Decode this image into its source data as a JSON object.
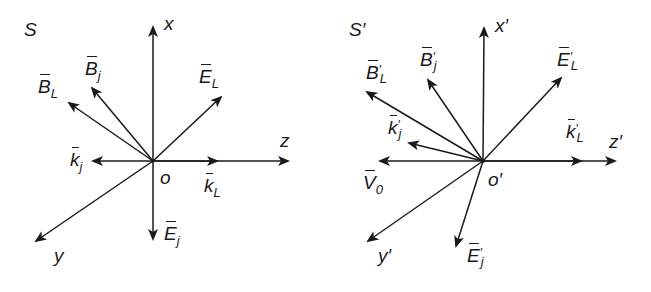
{
  "frames": [
    {
      "id": "S",
      "frame_label": "S",
      "origin_label": "o",
      "axes": {
        "x": "x",
        "y": "y",
        "z": "z"
      },
      "vectors": [
        {
          "name": "B_L",
          "base": "B",
          "sub": "L",
          "prime": false
        },
        {
          "name": "B_j",
          "base": "B",
          "sub": "j",
          "prime": false
        },
        {
          "name": "E_L",
          "base": "E",
          "sub": "L",
          "prime": false
        },
        {
          "name": "k_j",
          "base": "k",
          "sub": "j",
          "prime": false
        },
        {
          "name": "k_L",
          "base": "k",
          "sub": "L",
          "prime": false
        },
        {
          "name": "E_j",
          "base": "E",
          "sub": "j",
          "prime": false
        }
      ]
    },
    {
      "id": "S_prime",
      "frame_label": "S′",
      "origin_label": "o′",
      "axes": {
        "x": "x′",
        "y": "y′",
        "z": "z′"
      },
      "vectors": [
        {
          "name": "B'_L",
          "base": "B",
          "sub": "L",
          "prime": true
        },
        {
          "name": "B'_j",
          "base": "B",
          "sub": "j",
          "prime": true
        },
        {
          "name": "E'_L",
          "base": "E",
          "sub": "L",
          "prime": true
        },
        {
          "name": "k'_j",
          "base": "k",
          "sub": "j",
          "prime": true
        },
        {
          "name": "V_0",
          "base": "V",
          "sub": "0",
          "prime": false
        },
        {
          "name": "k'_L",
          "base": "k",
          "sub": "L",
          "prime": true
        },
        {
          "name": "E'_j",
          "base": "E",
          "sub": "j",
          "prime": true
        }
      ]
    }
  ],
  "colors": {
    "ink": "#1a1a1a",
    "background": "#ffffff"
  }
}
